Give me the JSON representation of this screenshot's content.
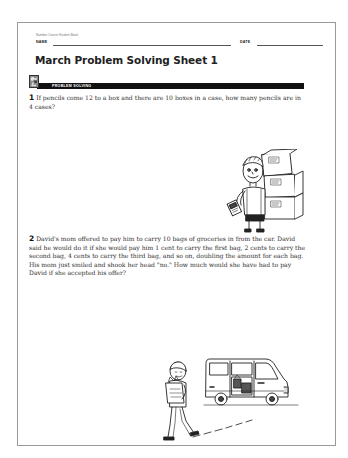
{
  "page": {
    "source_label": "Number Corner Student Book",
    "name_label": "NAME",
    "date_label": "DATE",
    "title": "March Problem Solving Sheet 1",
    "section": {
      "label": "PROBLEM SOLVING",
      "icon": "problem-solving-icon"
    },
    "problems": [
      {
        "number": "1",
        "text": "If pencils come 12 to a box and there are 10 boxes in a case, how many pencils are in 4 cases?",
        "illustration": "boy-carrying-pencil-boxes"
      },
      {
        "number": "2",
        "text": "David's mom offered to pay him to carry 10 bags of groceries in from the car. David said he would do it if she would pay him 1 cent to carry the first bag, 2 cents to carry the second bag, 4 cents to carry the third bag, and so on, doubling the amount for each bag. His mom just smiled and shook her head \"no.\" How much would she have had to pay David if she accepted his offer?",
        "illustration": "boy-carrying-groceries-from-van"
      }
    ]
  }
}
